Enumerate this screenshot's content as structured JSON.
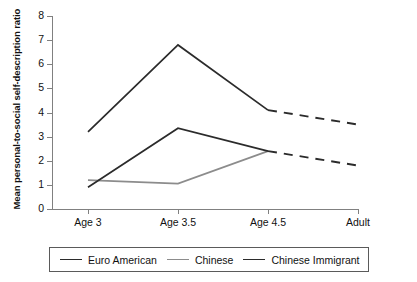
{
  "chart_data": {
    "type": "line",
    "title": "",
    "xlabel": "",
    "ylabel": "Mean personal-to-social self-description ratio",
    "categories": [
      "Age 3",
      "Age 3.5",
      "Age 4.5",
      "Adult"
    ],
    "ylim": [
      0,
      8
    ],
    "yticks": [
      0,
      1,
      2,
      3,
      4,
      5,
      6,
      7,
      8
    ],
    "grid": false,
    "legend_position": "bottom",
    "series": [
      {
        "name": "Euro American",
        "color": "#2b2b2b",
        "values": [
          3.2,
          6.8,
          4.1,
          3.5
        ],
        "dashed_from": "Age 4.5"
      },
      {
        "name": "Chinese",
        "color": "#8c8c8c",
        "values": [
          1.2,
          1.05,
          2.4,
          null
        ],
        "dashed_from": null
      },
      {
        "name": "Chinese Immigrant",
        "color": "#2b2b2b",
        "values": [
          0.9,
          3.35,
          2.4,
          1.8
        ],
        "dashed_from": "Age 4.5"
      }
    ]
  },
  "axis": {
    "y_title": "Mean personal-to-social self-description ratio",
    "y_tick_labels": [
      "0",
      "1",
      "2",
      "3",
      "4",
      "5",
      "6",
      "7",
      "8"
    ],
    "x_tick_labels": [
      "Age 3",
      "Age 3.5",
      "Age 4.5",
      "Adult"
    ]
  },
  "legend": {
    "items": [
      {
        "label": "Euro American",
        "color": "#2b2b2b"
      },
      {
        "label": "Chinese",
        "color": "#8c8c8c"
      },
      {
        "label": "Chinese Immigrant",
        "color": "#2b2b2b"
      }
    ]
  }
}
